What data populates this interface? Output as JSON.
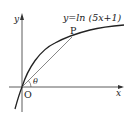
{
  "diagram": {
    "curve_label": "y=ln (5x+1)",
    "point_label": "P",
    "origin_label": "O",
    "angle_label": "θ",
    "x_axis_label": "x",
    "y_axis_label": "y",
    "colors": {
      "ink": "#222222",
      "chord": "#555555"
    }
  }
}
